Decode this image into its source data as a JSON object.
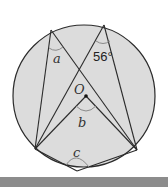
{
  "figure": {
    "type": "circle-theorem-diagram",
    "colors": {
      "circle_fill": "#dcdcdc",
      "stroke": "#2b2b2b",
      "arc": "#8a8a8a",
      "bottom_band": "#8c8c8c"
    },
    "circle": {
      "cx": 84,
      "cy": 96,
      "r": 71
    },
    "points": {
      "A": {
        "x": 51,
        "y": 30
      },
      "B": {
        "x": 104,
        "y": 25
      },
      "P": {
        "x": 35,
        "y": 149
      },
      "Q": {
        "x": 137,
        "y": 150
      },
      "R": {
        "x": 77,
        "y": 171
      },
      "O": {
        "x": 86,
        "y": 96
      }
    },
    "labels": {
      "angle_a": "a",
      "angle_56": "56°",
      "center": "O",
      "angle_b": "b",
      "angle_c": "c"
    }
  }
}
